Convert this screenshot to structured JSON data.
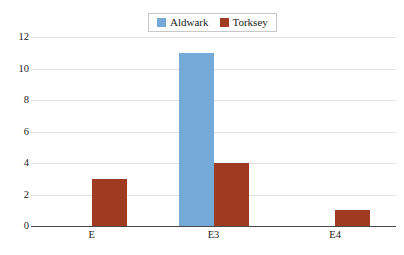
{
  "chart_data": {
    "type": "bar",
    "title": "",
    "subtitle": "",
    "xlabel": "",
    "ylabel": "",
    "categories": [
      "E",
      "E3",
      "E4"
    ],
    "series": [
      {
        "name": "Aldwark",
        "color": "#74a9d8",
        "values": [
          0,
          11,
          0
        ]
      },
      {
        "name": "Torksey",
        "color": "#9e3b20",
        "values": [
          3,
          4,
          1
        ]
      }
    ],
    "ylim": [
      0,
      12
    ],
    "yticks": [
      0,
      2,
      4,
      6,
      8,
      10,
      12
    ],
    "ytick_labels": [
      "0",
      "2",
      "4",
      "6",
      "8",
      "10",
      "12"
    ],
    "grid": true,
    "grid_axis": "y",
    "grid_color": "#e2e2e2",
    "legend_position": "top-center",
    "axis_color": "#4a4a4a",
    "background": "#ffffff"
  },
  "legend": {
    "entries": [
      {
        "label": "Aldwark",
        "color": "#74a9d8",
        "swatch_name": "legend-swatch-aldwark"
      },
      {
        "label": "Torksey",
        "color": "#9e3b20",
        "swatch_name": "legend-swatch-torksey"
      }
    ]
  }
}
